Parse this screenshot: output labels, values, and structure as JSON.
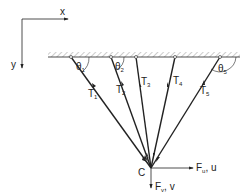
{
  "axes": {
    "x_label": "x",
    "y_label": "y"
  },
  "point": {
    "label": "C"
  },
  "cables": [
    {
      "name": "T",
      "sub": "1",
      "angle": "θ",
      "angle_sub": "1"
    },
    {
      "name": "T",
      "sub": "2",
      "angle": "θ",
      "angle_sub": "2"
    },
    {
      "name": "T",
      "sub": "3"
    },
    {
      "name": "T",
      "sub": "4"
    },
    {
      "name": "T",
      "sub": "5",
      "angle": "θ",
      "angle_sub": "5"
    }
  ],
  "forces": {
    "horizontal": {
      "name": "F",
      "sub": "u",
      "disp": ", u"
    },
    "vertical": {
      "name": "F",
      "sub": "v",
      "disp": ", v"
    }
  },
  "colors": {
    "line": "#222222",
    "hatch": "#888888"
  }
}
